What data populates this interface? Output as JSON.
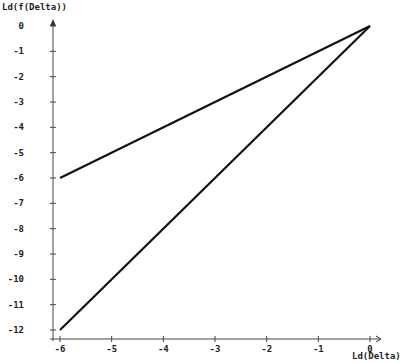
{
  "chart_data": {
    "type": "line",
    "title": "",
    "xlabel": "Ld(Delta)",
    "ylabel": "Ld(f(Delta))",
    "xlim": [
      -6,
      0
    ],
    "ylim": [
      -12,
      0
    ],
    "x_ticks": [
      "-6",
      "-5",
      "-4",
      "-3",
      "-2",
      "-1",
      "0"
    ],
    "y_ticks": [
      "0",
      "-1",
      "-2",
      "-3",
      "-4",
      "-5",
      "-6",
      "-7",
      "-8",
      "-9",
      "-10",
      "-11",
      "-12"
    ],
    "grid": false,
    "series": [
      {
        "name": "slope 1",
        "x": [
          -6,
          0
        ],
        "y": [
          -6,
          0
        ]
      },
      {
        "name": "slope 2",
        "x": [
          -6,
          0
        ],
        "y": [
          -12,
          0
        ]
      }
    ]
  }
}
